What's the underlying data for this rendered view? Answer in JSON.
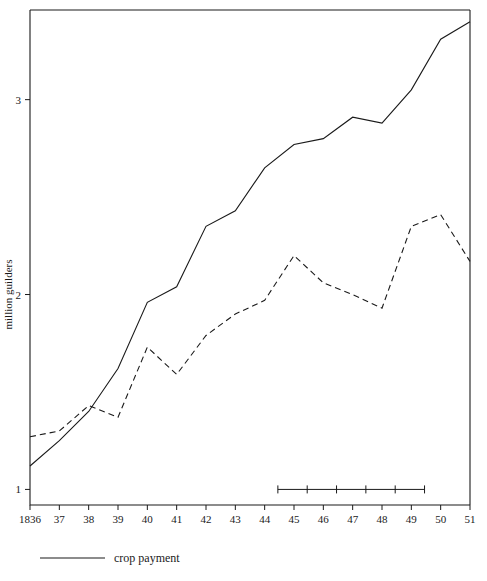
{
  "chart_data": {
    "type": "line",
    "title": "",
    "subtitle": "",
    "xlabel": "",
    "ylabel": "million guilders",
    "xlim": [
      1836,
      1851
    ],
    "ylim": [
      0.92,
      3.46
    ],
    "yticks": [
      1,
      2,
      3
    ],
    "ytick_labels": [
      "1",
      "2",
      "3"
    ],
    "grid": false,
    "legend_position": "below-axes-left",
    "x": [
      1836,
      1837,
      1838,
      1839,
      1840,
      1841,
      1842,
      1843,
      1844,
      1845,
      1846,
      1847,
      1848,
      1849,
      1850,
      1851
    ],
    "xtick_labels": [
      "1836",
      "37",
      "38",
      "39",
      "40",
      "41",
      "42",
      "43",
      "44",
      "45",
      "46",
      "47",
      "48",
      "49",
      "50",
      "51"
    ],
    "series": [
      {
        "name": "crop payment",
        "style": "solid",
        "color": "#1a1a1a",
        "values": [
          1.12,
          1.25,
          1.4,
          1.62,
          1.96,
          2.04,
          2.35,
          2.43,
          2.65,
          2.77,
          2.8,
          2.91,
          2.88,
          3.05,
          3.31,
          3.4
        ]
      },
      {
        "name": "",
        "style": "dashed",
        "color": "#1a1a1a",
        "values": [
          1.27,
          1.3,
          1.43,
          1.37,
          1.73,
          1.59,
          1.79,
          1.9,
          1.97,
          2.2,
          2.06,
          2.0,
          1.93,
          2.35,
          2.41,
          2.17
        ]
      }
    ],
    "annotations": [
      {
        "name": "scale-bracket",
        "type": "tick-ruler",
        "y_value": 1.0,
        "x_start": 1844.45,
        "x_end": 1849.45,
        "tick_count": 6
      }
    ]
  },
  "legend": {
    "entries": [
      {
        "label": "crop payment",
        "style": "solid"
      }
    ]
  },
  "axis": {
    "y_title": "million guilders"
  }
}
